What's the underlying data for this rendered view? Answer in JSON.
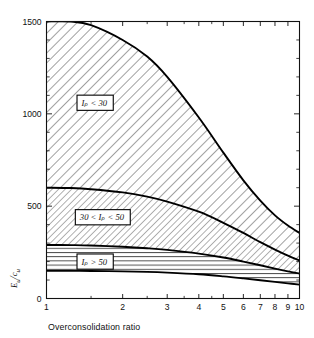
{
  "chart_data": {
    "type": "area",
    "title": "",
    "subtitle": "",
    "xlabel": "Overconsolidation ratio",
    "ylabel": "Eᵤ/cᵤ",
    "ylabel_parts": {
      "main": "E",
      "main_sub": "u",
      "denom": "c",
      "denom_sub": "u"
    },
    "xscale": "log",
    "yscale": "linear",
    "xlim": [
      1,
      10
    ],
    "ylim": [
      0,
      1500
    ],
    "grid": false,
    "legend": "inline-boxed-labels",
    "xticks": [
      1,
      2,
      3,
      4,
      5,
      6,
      7,
      8,
      9,
      10
    ],
    "xticklabels": [
      "1",
      "2",
      "3",
      "4",
      "5",
      "6",
      "7",
      "8",
      "9",
      "10"
    ],
    "yticks": [
      0,
      500,
      1000,
      1500
    ],
    "yticklabels": [
      "0",
      "500",
      "1000",
      "1500"
    ],
    "yminorticks": [
      100,
      200,
      300,
      400,
      600,
      700,
      800,
      900,
      1100,
      1200,
      1300,
      1400
    ],
    "x": [
      1,
      1.25,
      1.5,
      2,
      2.5,
      3,
      4,
      5,
      6,
      7,
      8,
      9,
      10
    ],
    "bands": [
      {
        "name": "Ip less than 30",
        "label": "Iₚ < 30",
        "hatch": "diagonal-coarse",
        "upper_values": [
          1500,
          1500,
          1480,
          1400,
          1310,
          1200,
          980,
          790,
          640,
          530,
          450,
          395,
          355
        ],
        "lower_values": [
          600,
          598,
          592,
          575,
          552,
          525,
          470,
          410,
          355,
          305,
          265,
          232,
          205
        ],
        "label_x": 1.32,
        "label_y": 1060
      },
      {
        "name": "Ip between 30 and 50",
        "label": "30 < Iₚ < 50",
        "hatch": "diagonal-fine",
        "upper_values": [
          600,
          598,
          592,
          575,
          552,
          525,
          470,
          410,
          355,
          305,
          265,
          232,
          205
        ],
        "lower_values": [
          290,
          289,
          287,
          280,
          272,
          263,
          243,
          222,
          200,
          180,
          162,
          147,
          135
        ],
        "label_x": 1.3,
        "label_y": 440
      },
      {
        "name": "Ip greater than 50",
        "label": "Iₚ > 50",
        "hatch": "horizontal",
        "upper_values": [
          290,
          289,
          287,
          280,
          272,
          263,
          243,
          222,
          200,
          180,
          162,
          147,
          135
        ],
        "lower_values": [
          150,
          150,
          149,
          147,
          144,
          140,
          131,
          120,
          109,
          99,
          90,
          82,
          75
        ],
        "label_x": 1.32,
        "label_y": 200
      }
    ],
    "annotations": [
      {
        "text": "Iₚ < 30",
        "x": 1.32,
        "y": 1060
      },
      {
        "text": "30 < Iₚ < 50",
        "x": 1.3,
        "y": 440
      },
      {
        "text": "Iₚ > 50",
        "x": 1.32,
        "y": 200
      }
    ]
  },
  "colors": {
    "axis": "#111111",
    "curve": "#000000",
    "background": "#ffffff",
    "hatch": "#555555"
  }
}
